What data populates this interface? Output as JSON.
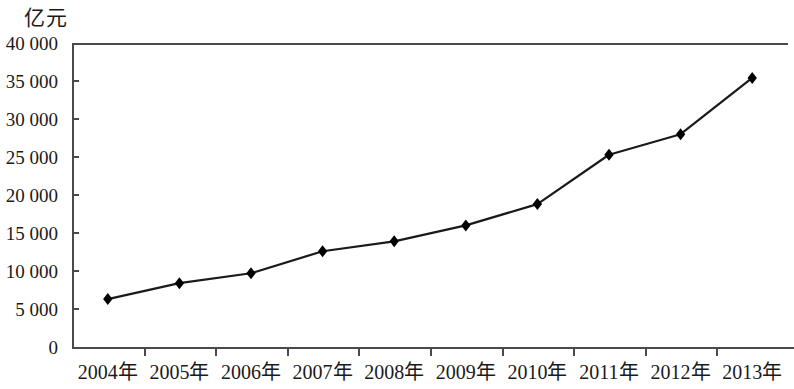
{
  "chart_data": {
    "type": "line",
    "title": "",
    "subtitle": "",
    "xlabel": "",
    "ylabel": "亿元",
    "y_unit_caption": "亿元",
    "categories": [
      "2004年",
      "2005年",
      "2006年",
      "2007年",
      "2008年",
      "2009年",
      "2010年",
      "2011年",
      "2012年",
      "2013年"
    ],
    "values": [
      6300,
      8400,
      9700,
      12600,
      13900,
      16000,
      18800,
      25300,
      28000,
      35400
    ],
    "series": [
      {
        "name": "",
        "values": [
          6300,
          8400,
          9700,
          12600,
          13900,
          16000,
          18800,
          25300,
          28000,
          35400
        ]
      }
    ],
    "ylim": [
      0,
      40000
    ],
    "ytick_values": [
      0,
      5000,
      10000,
      15000,
      20000,
      25000,
      30000,
      35000,
      40000
    ],
    "ytick_labels": [
      "0",
      "5 000",
      "10 000",
      "15 000",
      "20 000",
      "25 000",
      "30 000",
      "35 000",
      "40 000"
    ],
    "grid": false,
    "legend": "none",
    "marker": "diamond",
    "line_color": "#1a1a1a",
    "marker_color": "#000000",
    "axis_color": "#4a4a4a",
    "background": "#ffffff"
  }
}
